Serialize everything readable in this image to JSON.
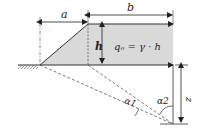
{
  "diagram": {
    "labels": {
      "a": "a",
      "b": "b",
      "h": "h",
      "load": "qₒ = γ · h",
      "alpha1": "α1",
      "alpha2": "α2",
      "z": "z"
    },
    "colors": {
      "fill": "#d9d9d9",
      "line": "#333333"
    }
  }
}
